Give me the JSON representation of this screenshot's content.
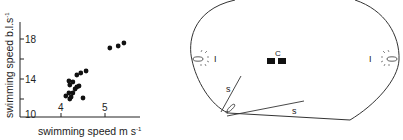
{
  "chart_data": {
    "type": "scatter",
    "title": "",
    "xlabel": "swimming speed  m s",
    "xlabel_superscript": "-1",
    "ylabel": "swimming speed  b.l.s",
    "ylabel_superscript": "-1",
    "xlim": [
      3.1,
      5.8
    ],
    "ylim": [
      10,
      20
    ],
    "xticks": [
      {
        "value": 4,
        "label": "4"
      },
      {
        "value": 5,
        "label": "5"
      }
    ],
    "yticks": [
      {
        "value": 10,
        "label": "10"
      },
      {
        "value": 12,
        "label": ""
      },
      {
        "value": 14,
        "label": "14"
      },
      {
        "value": 16,
        "label": ""
      },
      {
        "value": 18,
        "label": "18"
      }
    ],
    "points": [
      {
        "x": 4.11,
        "y": 12.3
      },
      {
        "x": 4.2,
        "y": 12.0
      },
      {
        "x": 4.23,
        "y": 12.2
      },
      {
        "x": 4.18,
        "y": 12.6
      },
      {
        "x": 4.27,
        "y": 12.6
      },
      {
        "x": 4.32,
        "y": 13.0
      },
      {
        "x": 4.36,
        "y": 13.2
      },
      {
        "x": 4.41,
        "y": 13.3
      },
      {
        "x": 4.2,
        "y": 13.4
      },
      {
        "x": 4.18,
        "y": 13.8
      },
      {
        "x": 4.27,
        "y": 13.7
      },
      {
        "x": 4.36,
        "y": 14.4
      },
      {
        "x": 4.45,
        "y": 14.6
      },
      {
        "x": 4.57,
        "y": 14.8
      },
      {
        "x": 4.5,
        "y": 12.1
      },
      {
        "x": 5.11,
        "y": 17.1
      },
      {
        "x": 5.3,
        "y": 17.3
      },
      {
        "x": 5.43,
        "y": 17.6
      }
    ]
  },
  "diagram": {
    "labels": {
      "center": "C",
      "light_left": "I",
      "light_right": "I",
      "segment_1": "s",
      "segment_2": "s"
    }
  }
}
